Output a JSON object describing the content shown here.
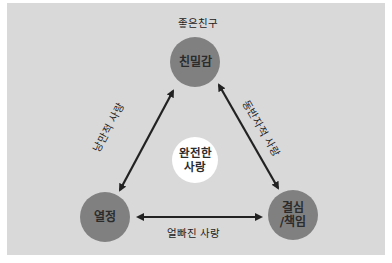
{
  "diagram": {
    "title_label": "좋은친구",
    "nodes": {
      "top": {
        "label": "친밀감"
      },
      "left": {
        "label": "열정"
      },
      "right": {
        "line1": "결심",
        "line2": "/책임"
      },
      "center": {
        "line1": "완전한",
        "line2": "사랑"
      }
    },
    "edges": {
      "left": {
        "label": "낭만적 사랑",
        "from": "열정",
        "to": "친밀감"
      },
      "right": {
        "label": "동반자적 사랑",
        "from": "친밀감",
        "to": "결심/책임"
      },
      "bottom": {
        "label": "얼빠진 사랑",
        "from": "열정",
        "to": "결심/책임"
      }
    },
    "colors": {
      "background": "#d9d9d9",
      "node_fill": "#808080",
      "center_fill": "#ffffff",
      "arrow": "#222222"
    }
  }
}
